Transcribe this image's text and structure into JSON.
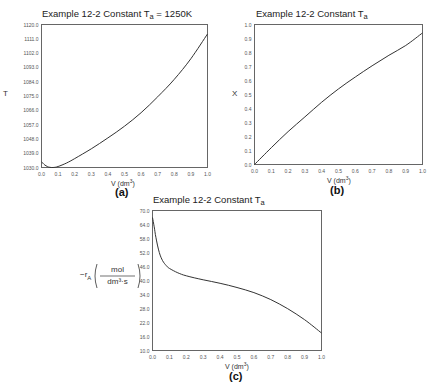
{
  "chart_data": [
    {
      "id": "a",
      "type": "line",
      "panel_label": "(a)",
      "title": "Example 12-2 Constant Ta = 1250K",
      "title_main": "Example 12-2 Constant T",
      "title_sub": "a",
      "title_suffix": " = 1250K",
      "xlabel": "V (dm3)",
      "xlabel_main": "V (dm",
      "xlabel_sup": "3",
      "xlabel_close": ")",
      "ylabel": "T",
      "xlim": [
        0.0,
        1.0
      ],
      "ylim": [
        1030.0,
        1120.0
      ],
      "xticks": [
        "0.0",
        "0.1",
        "0.2",
        "0.3",
        "0.4",
        "0.5",
        "0.6",
        "0.7",
        "0.8",
        "0.9",
        "1.0"
      ],
      "yticks": [
        "1120.0",
        "1111.0",
        "1102.0",
        "1093.0",
        "1084.0",
        "1075.0",
        "1066.0",
        "1057.0",
        "1048.0",
        "1039.0",
        "1030.0"
      ],
      "grid": false,
      "x": [
        0.0,
        0.01,
        0.02,
        0.035,
        0.05,
        0.07,
        0.1,
        0.15,
        0.2,
        0.3,
        0.4,
        0.5,
        0.6,
        0.7,
        0.8,
        0.9,
        1.0
      ],
      "values": [
        1033.5,
        1032.6,
        1031.6,
        1030.6,
        1030.1,
        1030.0,
        1030.6,
        1032.8,
        1035.6,
        1041.8,
        1048.6,
        1056.0,
        1064.5,
        1074.5,
        1085.5,
        1098.5,
        1114.0
      ]
    },
    {
      "id": "b",
      "type": "line",
      "panel_label": "(b)",
      "title": "Example 12-2 Constant Ta",
      "title_main": "Example 12-2 Constant T",
      "title_sub": "a",
      "title_suffix": "",
      "xlabel": "V (dm3)",
      "xlabel_main": "V (dm",
      "xlabel_sup": "3",
      "xlabel_close": ")",
      "ylabel": "X",
      "xlim": [
        0.0,
        1.0
      ],
      "ylim": [
        0.0,
        1.0
      ],
      "xticks": [
        "0.0",
        "0.1",
        "0.2",
        "0.3",
        "0.4",
        "0.5",
        "0.6",
        "0.7",
        "0.8",
        "0.9",
        "1.0"
      ],
      "yticks": [
        "1.0",
        "0.9",
        "0.8",
        "0.7",
        "0.6",
        "0.5",
        "0.4",
        "0.3",
        "0.2",
        "0.1",
        "0.0"
      ],
      "grid": false,
      "x": [
        0.0,
        0.1,
        0.2,
        0.3,
        0.4,
        0.5,
        0.6,
        0.7,
        0.8,
        0.9,
        1.0
      ],
      "values": [
        0.0,
        0.12,
        0.235,
        0.34,
        0.445,
        0.54,
        0.625,
        0.705,
        0.78,
        0.85,
        0.94
      ]
    },
    {
      "id": "c",
      "type": "line",
      "panel_label": "(c)",
      "title": "Example 12-2 Constant Ta",
      "title_main": "Example 12-2 Constant T",
      "title_sub": "a",
      "title_suffix": "",
      "xlabel": "V (dm3)",
      "xlabel_main": "V (dm",
      "xlabel_sup": "3",
      "xlabel_close": ")",
      "ylabel": "-rA (mol / dm3·s)",
      "ylabel_main": "−r",
      "ylabel_sub": "A",
      "ylabel_num": "mol",
      "ylabel_den": "dm³·s",
      "xlim": [
        0.0,
        1.0
      ],
      "ylim": [
        10.0,
        70.0
      ],
      "xticks": [
        "0.0",
        "0.1",
        "0.2",
        "0.3",
        "0.4",
        "0.5",
        "0.6",
        "0.7",
        "0.8",
        "0.9",
        "1.0"
      ],
      "yticks": [
        "70.0",
        "64.0",
        "58.0",
        "52.0",
        "46.0",
        "40.0",
        "34.0",
        "28.0",
        "22.0",
        "16.0",
        "10.0"
      ],
      "grid": false,
      "x": [
        0.0,
        0.01,
        0.02,
        0.04,
        0.06,
        0.08,
        0.1,
        0.15,
        0.2,
        0.3,
        0.4,
        0.5,
        0.6,
        0.7,
        0.8,
        0.9,
        1.0
      ],
      "values": [
        67.0,
        63.0,
        58.5,
        52.0,
        48.5,
        46.5,
        45.2,
        43.3,
        42.0,
        40.3,
        38.8,
        37.0,
        34.8,
        31.8,
        27.9,
        23.2,
        17.5
      ]
    }
  ]
}
